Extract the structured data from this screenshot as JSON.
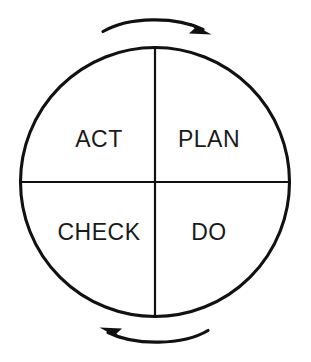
{
  "diagram": {
    "name": "PDCA Cycle",
    "type": "cycle-diagram",
    "background_color": "#ffffff",
    "line_color": "#111111",
    "text_color": "#1a1a1a",
    "circle": {
      "center_x": 155,
      "center_y": 182,
      "radius": 135
    },
    "quadrants": [
      {
        "id": "plan",
        "label": "PLAN",
        "position": "top-right",
        "label_x": 209,
        "label_y": 147
      },
      {
        "id": "do",
        "label": "DO",
        "position": "bottom-right",
        "label_x": 209,
        "label_y": 240
      },
      {
        "id": "check",
        "label": "CHECK",
        "position": "bottom-left",
        "label_x": 99,
        "label_y": 240
      },
      {
        "id": "act",
        "label": "ACT",
        "position": "top-left",
        "label_x": 99,
        "label_y": 147
      }
    ],
    "arrows": [
      {
        "id": "top-arrow",
        "direction": "clockwise-rightward",
        "position": "above-circle"
      },
      {
        "id": "bottom-arrow",
        "direction": "clockwise-leftward",
        "position": "below-circle"
      }
    ]
  }
}
